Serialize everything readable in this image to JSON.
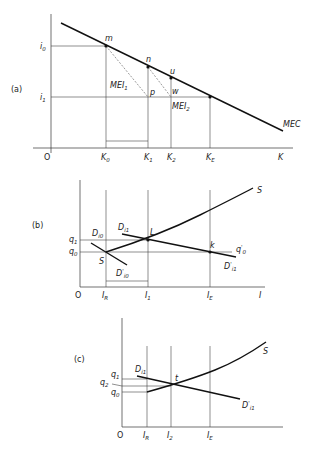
{
  "panel_a": {
    "tag": "(a)",
    "y_labels": {
      "i0": "i",
      "i0_sub": "0",
      "i1": "i",
      "i1_sub": "1"
    },
    "x_labels": {
      "origin": "O",
      "K0": "K",
      "K0_sub": "0",
      "K1": "K",
      "K1_sub": "1",
      "K2": "K",
      "K2_sub": "2",
      "KE": "K",
      "KE_sub": "E",
      "axis": "K"
    },
    "points": {
      "m": "m",
      "n": "n",
      "u": "u",
      "p": "p",
      "w": "w"
    },
    "curves": {
      "mec": "MEC",
      "mei1": "MEI",
      "mei1_sub": "1",
      "mei2": "MEI",
      "mei2_sub": "2"
    }
  },
  "panel_b": {
    "tag": "(b)",
    "y_labels": {
      "q1": "q",
      "q1_sub": "1",
      "q0": "q",
      "q0_sub": "0"
    },
    "x_labels": {
      "origin": "O",
      "IR": "I",
      "IR_sub": "R",
      "I1": "I",
      "I1_sub": "1",
      "IE": "I",
      "IE_sub": "E",
      "axis": "I"
    },
    "points": {
      "S": "S",
      "L": "L",
      "k": "k"
    },
    "curves": {
      "supply": "S",
      "Di0": "D",
      "Di0_sub": "i0",
      "Di0p": "D",
      "Di0p_sub": "i0",
      "Di1": "D",
      "Di1_sub": "i1",
      "Di1p": "D",
      "Di1p_sub": "i1",
      "q0p": "q",
      "q0p_sub": "0",
      "prime": "'"
    }
  },
  "panel_c": {
    "tag": "(c)",
    "y_labels": {
      "q1": "q",
      "q1_sub": "1",
      "q2": "q",
      "q2_sub": "2",
      "q0": "q",
      "q0_sub": "0"
    },
    "x_labels": {
      "origin": "O",
      "IR": "I",
      "IR_sub": "R",
      "I2": "I",
      "I2_sub": "2",
      "IE": "I",
      "IE_sub": "E"
    },
    "points": {
      "t": "t"
    },
    "curves": {
      "supply": "S",
      "Di1": "D",
      "Di1_sub": "i1",
      "Di1p": "D",
      "Di1p_sub": "i1",
      "prime": "'"
    }
  }
}
